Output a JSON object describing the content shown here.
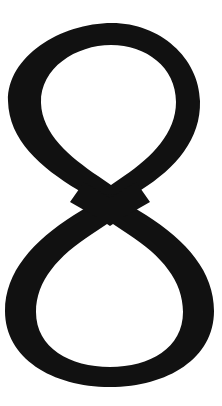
{
  "image": {
    "kind": "glyph-image",
    "content_type": "typographic-character",
    "character": "8",
    "character_name": "digit-eight",
    "description": "Large black numeral eight on a plain white background",
    "style": "high-contrast didone serif, crossing-loop construction",
    "width": 222,
    "height": 406
  },
  "colors": {
    "background": "#ffffff",
    "ink": "#111111"
  },
  "geometry": {
    "glyph_bounds": {
      "left": 5,
      "top": 23,
      "right": 214,
      "bottom": 387
    },
    "waist_crossing": {
      "x": 105,
      "y": 200
    },
    "upper_bowl": {
      "left": 8,
      "right": 200,
      "top": 23,
      "bottom": 210
    },
    "lower_bowl": {
      "left": 5,
      "right": 214,
      "top": 190,
      "bottom": 387
    },
    "stroke": {
      "thin_top": 20,
      "thin_bottom": 25,
      "thick_side": 40
    }
  }
}
